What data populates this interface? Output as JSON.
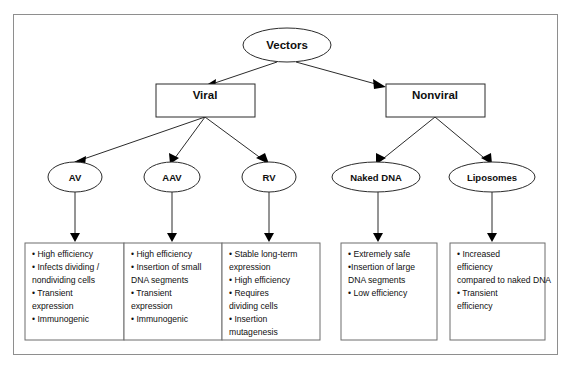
{
  "figure": {
    "root": {
      "label": "Vectors",
      "shape": "ellipse"
    },
    "branches": [
      {
        "label": "Viral",
        "shape": "rect"
      },
      {
        "label": "Nonviral",
        "shape": "rect"
      }
    ],
    "vectors": [
      {
        "label": "AV",
        "shape": "ellipse",
        "parent": "Viral"
      },
      {
        "label": "AAV",
        "shape": "ellipse",
        "parent": "Viral"
      },
      {
        "label": "RV",
        "shape": "ellipse",
        "parent": "Viral"
      },
      {
        "label": "Naked DNA",
        "shape": "ellipse",
        "parent": "Nonviral"
      },
      {
        "label": "Liposomes",
        "shape": "ellipse",
        "parent": "Nonviral"
      }
    ],
    "property_boxes": [
      {
        "vector": "AV",
        "lines": [
          "• High efficiency",
          "• Infects dividing /",
          "nondividing cells",
          "• Transient",
          "expression",
          "• Immunogenic"
        ]
      },
      {
        "vector": "AAV",
        "lines": [
          "• High efficiency",
          "• Insertion of small",
          "DNA segments",
          "• Transient",
          "expression",
          "• Immunogenic"
        ]
      },
      {
        "vector": "RV",
        "lines": [
          "• Stable long-term",
          "expression",
          "• High efficiency",
          "• Requires",
          "dividing cells",
          "• Insertion",
          "mutagenesis"
        ]
      },
      {
        "vector": "Naked DNA",
        "lines": [
          "• Extremely safe",
          "•Insertion of large",
          "DNA segments",
          "• Low efficiency"
        ]
      },
      {
        "vector": "Liposomes",
        "lines": [
          "• Increased",
          "efficiency",
          "compared to naked DNA",
          "• Transient",
          "efficiency"
        ]
      }
    ],
    "colors": {
      "background": "#ffffff",
      "frame_border": "#8e8e8e",
      "node_stroke": "#2b2b2b",
      "box_stroke": "#6d6d6d",
      "text": "#0f0f0f",
      "arrow_fill": "#000000"
    }
  }
}
